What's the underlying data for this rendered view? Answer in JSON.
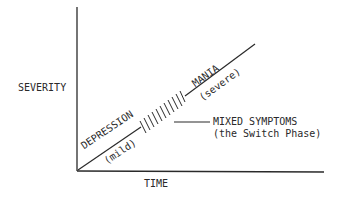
{
  "diagram": {
    "y_axis_label": "SEVERITY",
    "x_axis_label": "TIME",
    "segments": [
      {
        "name": "depression",
        "label": "DEPRESSION",
        "sublabel": "(mild)"
      },
      {
        "name": "mixed",
        "label": "MIXED SYMPTOMS",
        "sublabel": "(the Switch Phase)"
      },
      {
        "name": "mania",
        "label": "MANIA",
        "sublabel": "(severe)"
      }
    ],
    "colors": {
      "ink": "#2a2a2a",
      "background": "#ffffff"
    }
  }
}
